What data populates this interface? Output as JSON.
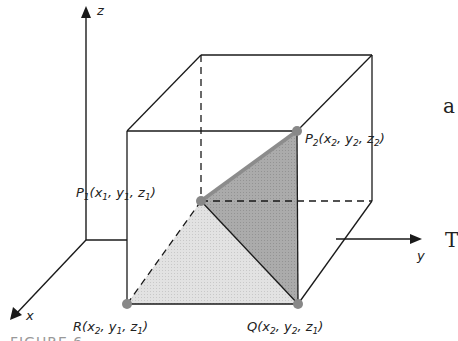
{
  "figure": {
    "caption": "FIGURE 6",
    "axes": {
      "x": "x",
      "y": "y",
      "z": "z"
    },
    "points": {
      "P1": {
        "name": "P",
        "sub": "1",
        "coords": [
          "x",
          "1",
          "y",
          "1",
          "z",
          "1"
        ]
      },
      "P2": {
        "name": "P",
        "sub": "2",
        "coords": [
          "x",
          "2",
          "y",
          "2",
          "z",
          "2"
        ]
      },
      "R": {
        "name": "R",
        "coords": [
          "x",
          "2",
          "y",
          "1",
          "z",
          "1"
        ]
      },
      "Q": {
        "name": "Q",
        "coords": [
          "x",
          "2",
          "y",
          "2",
          "z",
          "1"
        ]
      }
    },
    "side_text": {
      "top": "a",
      "bottom": "T"
    },
    "colors": {
      "line": "#1a1a1a",
      "point": "#888888",
      "light_fill": "#dcdcdc",
      "dark_fill": "#a9a9a9",
      "highlight_edge": "#8c8c8c"
    }
  }
}
